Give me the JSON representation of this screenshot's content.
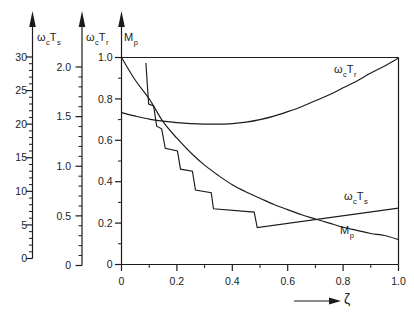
{
  "figure": {
    "background_color": "#ffffff",
    "line_color": "#1b1b1b"
  },
  "chart_data": {
    "type": "line",
    "title": "",
    "x_axis": {
      "label": "ζ",
      "range": [
        0,
        1.0
      ],
      "major_ticks": [
        {
          "v": 0,
          "label": "0"
        },
        {
          "v": 0.2,
          "label": "0.2"
        },
        {
          "v": 0.4,
          "label": "0.4"
        },
        {
          "v": 0.6,
          "label": "0.6"
        },
        {
          "v": 0.8,
          "label": "0.8"
        },
        {
          "v": 1.0,
          "label": "1.0"
        }
      ],
      "minor_ticks": [
        0.1,
        0.3,
        0.5,
        0.7,
        0.9
      ]
    },
    "y_axes": [
      {
        "id": "omega_c_Ts",
        "label_parts": [
          {
            "t": "ω"
          },
          {
            "t": "c",
            "sub": true
          },
          {
            "t": "T"
          },
          {
            "t": "s",
            "sub": true
          }
        ],
        "range": [
          0,
          30
        ],
        "major_ticks": [
          {
            "v": 0,
            "label": "0"
          },
          {
            "v": 5,
            "label": "5"
          },
          {
            "v": 10,
            "label": "10"
          },
          {
            "v": 15,
            "label": "15"
          },
          {
            "v": 20,
            "label": "20"
          },
          {
            "v": 25,
            "label": "25"
          },
          {
            "v": 30,
            "label": "30"
          }
        ],
        "minor_ticks": [
          1,
          2,
          3,
          4,
          6,
          7,
          8,
          9,
          11,
          12,
          13,
          14,
          16,
          17,
          18,
          19,
          21,
          22,
          23,
          24,
          26,
          27,
          28,
          29
        ]
      },
      {
        "id": "omega_c_Tr",
        "label_parts": [
          {
            "t": "ω"
          },
          {
            "t": "c",
            "sub": true
          },
          {
            "t": "T"
          },
          {
            "t": "r",
            "sub": true
          }
        ],
        "range": [
          0,
          2.0
        ],
        "major_ticks": [
          {
            "v": 0,
            "label": "0"
          },
          {
            "v": 0.5,
            "label": "0.5"
          },
          {
            "v": 1.0,
            "label": "1.0"
          },
          {
            "v": 1.5,
            "label": "1.5"
          },
          {
            "v": 2.0,
            "label": "2.0"
          }
        ],
        "minor_ticks": [
          0.1,
          0.2,
          0.3,
          0.4,
          0.6,
          0.7,
          0.8,
          0.9,
          1.1,
          1.2,
          1.3,
          1.4,
          1.6,
          1.7,
          1.8,
          1.9
        ]
      },
      {
        "id": "Mp",
        "label_parts": [
          {
            "t": "M"
          },
          {
            "t": "p",
            "sub": true
          }
        ],
        "range": [
          0,
          1.0
        ],
        "major_ticks": [
          {
            "v": 0,
            "label": "0"
          },
          {
            "v": 0.2,
            "label": "0.2"
          },
          {
            "v": 0.4,
            "label": "0.4"
          },
          {
            "v": 0.6,
            "label": "0.6"
          },
          {
            "v": 0.8,
            "label": "0.8"
          },
          {
            "v": 1.0,
            "label": "1.0"
          }
        ],
        "minor_ticks": [
          0.1,
          0.3,
          0.5,
          0.7,
          0.9
        ]
      }
    ],
    "reference_line": {
      "axis": "Mp",
      "value": 1.0
    },
    "series": [
      {
        "name": "omega_c_Tr",
        "label_parts": [
          {
            "t": "ω"
          },
          {
            "t": "c",
            "sub": true
          },
          {
            "t": "T"
          },
          {
            "t": "r",
            "sub": true
          }
        ],
        "axis": "omega_c_Tr",
        "smooth": true,
        "points": [
          [
            0,
            1.54
          ],
          [
            0.05,
            1.505
          ],
          [
            0.1,
            1.475
          ],
          [
            0.15,
            1.455
          ],
          [
            0.2,
            1.44
          ],
          [
            0.25,
            1.43
          ],
          [
            0.3,
            1.425
          ],
          [
            0.35,
            1.425
          ],
          [
            0.4,
            1.43
          ],
          [
            0.45,
            1.445
          ],
          [
            0.5,
            1.47
          ],
          [
            0.55,
            1.505
          ],
          [
            0.6,
            1.55
          ],
          [
            0.65,
            1.6
          ],
          [
            0.7,
            1.66
          ],
          [
            0.75,
            1.72
          ],
          [
            0.8,
            1.79
          ],
          [
            0.85,
            1.86
          ],
          [
            0.9,
            1.94
          ],
          [
            0.95,
            2.01
          ],
          [
            1.0,
            2.09
          ]
        ]
      },
      {
        "name": "omega_c_Ts",
        "label_parts": [
          {
            "t": "ω"
          },
          {
            "t": "c",
            "sub": true
          },
          {
            "t": "T"
          },
          {
            "t": "s",
            "sub": true
          }
        ],
        "axis": "omega_c_Ts",
        "smooth": false,
        "points": [
          [
            0.088,
            29.1
          ],
          [
            0.098,
            23.0
          ],
          [
            0.116,
            22.7
          ],
          [
            0.127,
            19.7
          ],
          [
            0.145,
            19.3
          ],
          [
            0.158,
            16.4
          ],
          [
            0.202,
            16.0
          ],
          [
            0.213,
            13.3
          ],
          [
            0.256,
            13.0
          ],
          [
            0.267,
            10.2
          ],
          [
            0.324,
            9.8
          ],
          [
            0.332,
            7.4
          ],
          [
            0.479,
            6.9
          ],
          [
            0.49,
            4.6
          ],
          [
            1.0,
            7.5
          ]
        ]
      },
      {
        "name": "Mp",
        "label_parts": [
          {
            "t": "M"
          },
          {
            "t": "p",
            "sub": true
          }
        ],
        "axis": "Mp",
        "smooth": true,
        "points": [
          [
            0,
            1.0
          ],
          [
            0.05,
            0.89
          ],
          [
            0.1,
            0.8
          ],
          [
            0.15,
            0.69
          ],
          [
            0.2,
            0.61
          ],
          [
            0.25,
            0.54
          ],
          [
            0.3,
            0.48
          ],
          [
            0.35,
            0.43
          ],
          [
            0.4,
            0.385
          ],
          [
            0.45,
            0.35
          ],
          [
            0.5,
            0.32
          ],
          [
            0.55,
            0.29
          ],
          [
            0.6,
            0.265
          ],
          [
            0.65,
            0.24
          ],
          [
            0.7,
            0.22
          ],
          [
            0.75,
            0.2
          ],
          [
            0.8,
            0.18
          ],
          [
            0.85,
            0.165
          ],
          [
            0.9,
            0.15
          ],
          [
            0.95,
            0.14
          ],
          [
            1.0,
            0.12
          ]
        ]
      }
    ]
  }
}
